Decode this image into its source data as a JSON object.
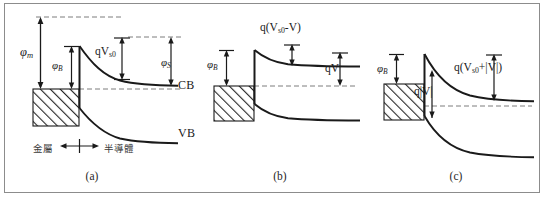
{
  "figure": {
    "panels": [
      {
        "id": "a",
        "caption": "(a)",
        "condition": "thermal equilibrium, zero bias",
        "labels": {
          "metal_work_function": "φ",
          "metal_work_function_sub": "m",
          "barrier_height": "φ",
          "barrier_height_sub": "B",
          "built_in_potential": "qV",
          "built_in_potential_sub": "s0",
          "semiconductor_work_function": "φ",
          "semiconductor_work_function_sub": "S",
          "conduction_band": "CB",
          "valence_band": "VB",
          "region_left": "金屬",
          "region_right": "半導體"
        }
      },
      {
        "id": "b",
        "caption": "(b)",
        "condition": "forward bias",
        "labels": {
          "barrier_height": "φ",
          "barrier_height_sub": "B",
          "band_bending_prefix": "q(V",
          "band_bending_sub": "s0",
          "band_bending_suffix": "-V)",
          "applied_bias": "qV"
        }
      },
      {
        "id": "c",
        "caption": "(c)",
        "condition": "reverse bias",
        "labels": {
          "barrier_height": "φ",
          "barrier_height_sub": "B",
          "band_bending_prefix": "q(V",
          "band_bending_sub": "s0",
          "band_bending_suffix": "+|V|)",
          "applied_bias": "q|V|"
        }
      }
    ],
    "colors": {
      "line": "#1a1a1a",
      "dashed": "#7d7d7d",
      "hatch": "#2b2b2b",
      "border": "#8c8c8c",
      "background": "#ffffff"
    }
  }
}
